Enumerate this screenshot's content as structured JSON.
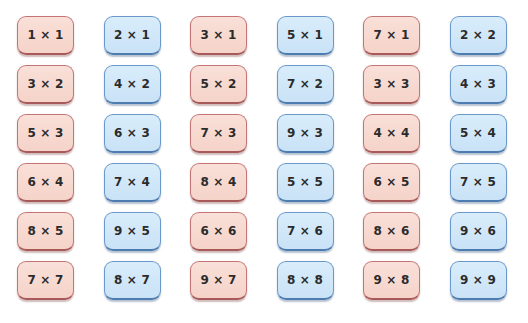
{
  "colors": {
    "pink_fill": "#f7d9d1",
    "pink_border": "#c06a6a",
    "blue_fill": "#cfe6f7",
    "blue_border": "#5f8fc4",
    "text": "#2b2b2b"
  },
  "cards": [
    {
      "label": "1 × 1",
      "color": "pink"
    },
    {
      "label": "2 × 1",
      "color": "blue"
    },
    {
      "label": "3 × 1",
      "color": "pink"
    },
    {
      "label": "5 × 1",
      "color": "blue"
    },
    {
      "label": "7 × 1",
      "color": "pink"
    },
    {
      "label": "2 × 2",
      "color": "blue"
    },
    {
      "label": "3 × 2",
      "color": "pink"
    },
    {
      "label": "4 × 2",
      "color": "blue"
    },
    {
      "label": "5 × 2",
      "color": "pink"
    },
    {
      "label": "7 × 2",
      "color": "blue"
    },
    {
      "label": "3 × 3",
      "color": "pink"
    },
    {
      "label": "4 × 3",
      "color": "blue"
    },
    {
      "label": "5 × 3",
      "color": "pink"
    },
    {
      "label": "6 × 3",
      "color": "blue"
    },
    {
      "label": "7 × 3",
      "color": "pink"
    },
    {
      "label": "9 × 3",
      "color": "blue"
    },
    {
      "label": "4 × 4",
      "color": "pink"
    },
    {
      "label": "5 × 4",
      "color": "blue"
    },
    {
      "label": "6 × 4",
      "color": "pink"
    },
    {
      "label": "7 × 4",
      "color": "blue"
    },
    {
      "label": "8 × 4",
      "color": "pink"
    },
    {
      "label": "5 × 5",
      "color": "blue"
    },
    {
      "label": "6 × 5",
      "color": "pink"
    },
    {
      "label": "7 × 5",
      "color": "blue"
    },
    {
      "label": "8 × 5",
      "color": "pink"
    },
    {
      "label": "9 × 5",
      "color": "blue"
    },
    {
      "label": "6 × 6",
      "color": "pink"
    },
    {
      "label": "7 × 6",
      "color": "blue"
    },
    {
      "label": "8 × 6",
      "color": "pink"
    },
    {
      "label": "9 × 6",
      "color": "blue"
    },
    {
      "label": "7 × 7",
      "color": "pink"
    },
    {
      "label": "8 × 7",
      "color": "blue"
    },
    {
      "label": "9 × 7",
      "color": "pink"
    },
    {
      "label": "8 × 8",
      "color": "blue"
    },
    {
      "label": "9 × 8",
      "color": "pink"
    },
    {
      "label": "9 × 9",
      "color": "blue"
    }
  ]
}
